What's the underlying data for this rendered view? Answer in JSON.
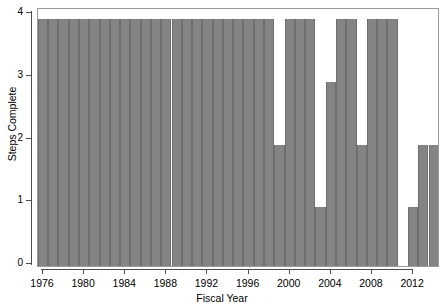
{
  "chart_data": {
    "type": "bar",
    "title": "",
    "xlabel": "Fiscal Year",
    "ylabel": "Steps Complete",
    "xlim": [
      1975.5,
      2014.5
    ],
    "ylim": [
      0,
      4
    ],
    "grid": false,
    "legend": null,
    "bar_color": "#848484",
    "xticks": [
      1976,
      1980,
      1984,
      1988,
      1992,
      1996,
      2000,
      2004,
      2008,
      2012
    ],
    "xtick_labels": [
      "1976",
      "1980",
      "1984",
      "1988",
      "1992",
      "1996",
      "2000",
      "2004",
      "2008",
      "2012"
    ],
    "yticks": [
      0,
      1,
      2,
      3,
      4
    ],
    "ytick_labels": [
      "0",
      "1",
      "2",
      "3",
      "4"
    ],
    "categories": [
      1976,
      1977,
      1978,
      1979,
      1980,
      1981,
      1982,
      1983,
      1984,
      1985,
      1986,
      1987,
      1988,
      1989,
      1990,
      1991,
      1992,
      1993,
      1994,
      1995,
      1996,
      1997,
      1998,
      1999,
      2000,
      2001,
      2002,
      2003,
      2004,
      2005,
      2006,
      2007,
      2008,
      2009,
      2010,
      2011,
      2012,
      2013,
      2014
    ],
    "values": [
      4,
      4,
      4,
      4,
      4,
      4,
      4,
      4,
      4,
      4,
      4,
      4,
      4,
      4,
      4,
      4,
      4,
      4,
      4,
      4,
      4,
      4,
      4,
      2,
      4,
      4,
      4,
      1,
      3,
      4,
      4,
      2,
      4,
      4,
      4,
      0,
      1,
      2,
      2
    ]
  },
  "axis": {
    "y_title": "Steps Complete",
    "x_title": "Fiscal Year"
  }
}
